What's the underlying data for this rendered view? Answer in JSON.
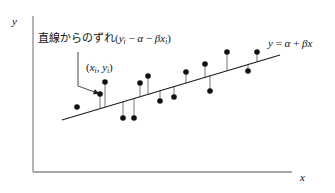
{
  "figure": {
    "background_color": "#ffffff",
    "ink_color": "#111111"
  },
  "axes": {
    "y_label": "y",
    "x_label": "x",
    "origin": [
      33,
      172
    ],
    "y_axis_top": 16,
    "x_axis_right": 292,
    "axis_color": "#8a8a8a"
  },
  "annotations": {
    "deviation": {
      "japanese_text": "直線からのずれ",
      "formula_open": "(",
      "formula_y": "y",
      "formula_y_sub": "i",
      "formula_minus1": " − ",
      "formula_alpha": "α",
      "formula_minus2": " − ",
      "formula_beta": "β",
      "formula_x": "x",
      "formula_x_sub": "i",
      "formula_close": ")",
      "full_text": "直線からのずれ (yi − α − βxi)"
    },
    "point_label": {
      "open": "(",
      "x_sym": "x",
      "x_sub": "i",
      "comma": ", ",
      "y_sym": "y",
      "y_sub": "i",
      "close": ")",
      "full_text": "(xi, yi)"
    },
    "line_equation": {
      "lhs": "y",
      "eq": " = ",
      "alpha": "α",
      "plus": " + ",
      "beta": "β",
      "x_sym": "x",
      "full_text": "y = α + βx"
    },
    "leader": {
      "start": [
        78,
        52
      ],
      "bend": [
        78,
        86
      ],
      "arrow_tip": [
        100,
        94
      ]
    }
  },
  "chart_data": {
    "type": "scatter",
    "title": "",
    "xlabel": "x",
    "ylabel": "y",
    "grid": false,
    "legend": "none",
    "xlim": [
      33,
      292
    ],
    "ylim": [
      172,
      16
    ],
    "note": "Coordinates are in screenshot pixel space; y increases downward.",
    "regression_line": {
      "label": "y = α + βx",
      "x_start": 62,
      "y_start": 120,
      "x_end": 280,
      "y_end": 55,
      "color": "#1a1a1a",
      "width": 1.1
    },
    "points": [
      {
        "x": 77,
        "y": 107,
        "residual_to_line": false
      },
      {
        "x": 100,
        "y": 94,
        "residual_to_line": true
      },
      {
        "x": 105,
        "y": 82,
        "residual_to_line": true
      },
      {
        "x": 123,
        "y": 118,
        "residual_to_line": true
      },
      {
        "x": 134,
        "y": 118,
        "residual_to_line": true
      },
      {
        "x": 140,
        "y": 83,
        "residual_to_line": true
      },
      {
        "x": 148,
        "y": 76,
        "residual_to_line": true
      },
      {
        "x": 160,
        "y": 101,
        "residual_to_line": true
      },
      {
        "x": 174,
        "y": 97,
        "residual_to_line": true
      },
      {
        "x": 186,
        "y": 72,
        "residual_to_line": true
      },
      {
        "x": 205,
        "y": 64,
        "residual_to_line": true
      },
      {
        "x": 210,
        "y": 91,
        "residual_to_line": true
      },
      {
        "x": 227,
        "y": 52,
        "residual_to_line": true
      },
      {
        "x": 248,
        "y": 71,
        "residual_to_line": true
      },
      {
        "x": 257,
        "y": 52,
        "residual_to_line": true
      }
    ],
    "point_style": {
      "marker": "circle",
      "radius": 2.8,
      "color": "#111111"
    },
    "residual_style": {
      "color": "#777777",
      "width": 1.0
    }
  }
}
